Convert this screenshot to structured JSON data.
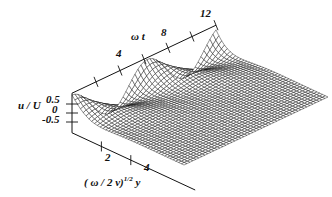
{
  "chart_data": {
    "type": "surface3d",
    "title": "",
    "axes": {
      "t": {
        "label": "ω t",
        "range": [
          0,
          12
        ],
        "ticks": [
          2,
          4,
          6,
          8,
          10,
          12
        ],
        "tick_labels": [
          "4",
          "8",
          "12"
        ]
      },
      "y": {
        "label_prefix": "( ω / 2 ν)",
        "label_exponent": "1/2",
        "label_suffix": " y",
        "range": [
          0,
          8
        ],
        "ticks": [
          2,
          4
        ],
        "tick_labels": [
          "2",
          "4"
        ]
      },
      "z": {
        "label": "u / U",
        "range": [
          -1,
          1
        ],
        "ticks": [
          0.5,
          0,
          -0.5
        ],
        "tick_labels": [
          "0.5",
          "0",
          "-0.5"
        ]
      }
    },
    "function": "u/U = exp(-eta) * cos(omega_t - eta)",
    "grid": {
      "t_steps": 48,
      "eta_steps": 40,
      "eta_max": 8
    },
    "style": {
      "line_color": "#111111",
      "background": "#ffffff"
    }
  },
  "labels": {
    "z_axis": "u / U",
    "z_ticks": [
      "0.5",
      "0",
      "-0.5"
    ],
    "t_axis": "ω t",
    "t_ticks": [
      "4",
      "8",
      "12"
    ],
    "y_axis_prefix": "( ω / 2 ν)",
    "y_axis_exp": "1/2",
    "y_axis_suffix": " y",
    "y_ticks": [
      "2",
      "4"
    ]
  }
}
